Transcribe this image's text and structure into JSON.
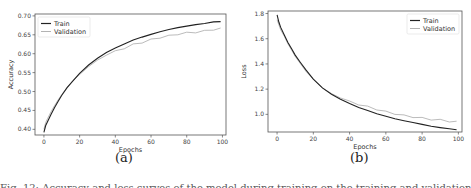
{
  "chart_data": [
    {
      "type": "line",
      "panel_label": "(a)",
      "title": "",
      "xlabel": "Epochs",
      "ylabel": "Accuracy",
      "xlim": [
        -5,
        102
      ],
      "ylim": [
        0.385,
        0.705
      ],
      "xticks": [
        0,
        20,
        40,
        60,
        80,
        100
      ],
      "yticks": [
        0.4,
        0.45,
        0.5,
        0.55,
        0.6,
        0.65,
        0.7
      ],
      "ytick_labels": [
        "0.40",
        "0.45",
        "0.50",
        "0.55",
        "0.60",
        "0.65",
        "0.70"
      ],
      "legend": {
        "position": "upper left",
        "entries": [
          "Train",
          "Validation"
        ]
      },
      "grid": false,
      "x": [
        0,
        1,
        2,
        4,
        6,
        8,
        10,
        13,
        16,
        20,
        25,
        30,
        35,
        40,
        45,
        50,
        55,
        60,
        65,
        70,
        75,
        80,
        85,
        90,
        95,
        99
      ],
      "series": [
        {
          "name": "Train",
          "color": "#222222",
          "values": [
            0.392,
            0.41,
            0.42,
            0.44,
            0.458,
            0.474,
            0.49,
            0.51,
            0.527,
            0.548,
            0.57,
            0.588,
            0.603,
            0.615,
            0.626,
            0.636,
            0.644,
            0.651,
            0.658,
            0.664,
            0.669,
            0.673,
            0.677,
            0.68,
            0.684,
            0.685
          ]
        },
        {
          "name": "Validation",
          "color": "#aaaaaa",
          "values": [
            0.4,
            0.418,
            0.428,
            0.447,
            0.463,
            0.478,
            0.492,
            0.511,
            0.527,
            0.545,
            0.566,
            0.583,
            0.596,
            0.606,
            0.615,
            0.624,
            0.63,
            0.637,
            0.643,
            0.647,
            0.652,
            0.655,
            0.657,
            0.66,
            0.664,
            0.666
          ]
        }
      ]
    },
    {
      "type": "line",
      "panel_label": "(b)",
      "title": "",
      "xlabel": "Epochs",
      "ylabel": "Loss",
      "xlim": [
        -5,
        102
      ],
      "ylim": [
        0.86,
        1.82
      ],
      "xticks": [
        0,
        20,
        40,
        60,
        80,
        100
      ],
      "yticks": [
        1.0,
        1.2,
        1.4,
        1.6,
        1.8
      ],
      "ytick_labels": [
        "1.0",
        "1.2",
        "1.4",
        "1.6",
        "1.8"
      ],
      "legend": {
        "position": "upper right",
        "entries": [
          "Train",
          "Validation"
        ]
      },
      "grid": false,
      "x": [
        0,
        1,
        2,
        4,
        6,
        8,
        10,
        13,
        16,
        20,
        25,
        30,
        35,
        40,
        45,
        50,
        55,
        60,
        65,
        70,
        75,
        80,
        85,
        90,
        95,
        99
      ],
      "series": [
        {
          "name": "Train",
          "color": "#222222",
          "values": [
            1.79,
            1.73,
            1.69,
            1.63,
            1.57,
            1.52,
            1.47,
            1.41,
            1.35,
            1.28,
            1.21,
            1.16,
            1.12,
            1.085,
            1.055,
            1.03,
            1.005,
            0.985,
            0.965,
            0.95,
            0.935,
            0.92,
            0.905,
            0.895,
            0.885,
            0.878
          ]
        },
        {
          "name": "Validation",
          "color": "#aaaaaa",
          "values": [
            1.75,
            1.71,
            1.67,
            1.62,
            1.56,
            1.51,
            1.46,
            1.4,
            1.34,
            1.28,
            1.21,
            1.165,
            1.13,
            1.1,
            1.08,
            1.06,
            1.04,
            1.02,
            1.005,
            0.99,
            0.98,
            0.97,
            0.96,
            0.955,
            0.945,
            0.94
          ]
        }
      ]
    }
  ],
  "labels": {
    "panel_a": "(a)",
    "panel_b": "(b)",
    "legend_train": "Train",
    "legend_validation": "Validation",
    "xlabel": "Epochs",
    "ylabel_a": "Accuracy",
    "ylabel_b": "Loss",
    "caption": "Fig. 12: Accuracy and loss curves of the model during training on the training and validation sets over 100 epochs."
  }
}
